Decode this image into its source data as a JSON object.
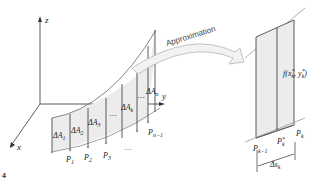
{
  "figure": {
    "marker": "4",
    "axes": {
      "x": "x",
      "y": "y",
      "z": "z"
    },
    "arrow_label": "Approximation",
    "left_panel": {
      "area_labels": [
        "ΔA1",
        "ΔA2",
        "ΔA3",
        "ΔAk",
        "ΔAn"
      ],
      "point_labels": [
        "P1",
        "P2",
        "P3",
        "Pn−1"
      ],
      "ellipses": [
        "…",
        "…",
        "…"
      ]
    },
    "right_panel": {
      "height_label": "f(x*k, y*k)",
      "point_labels": [
        "Pk−1",
        "P*k",
        "Pk"
      ],
      "width_label": "Δsk"
    }
  }
}
